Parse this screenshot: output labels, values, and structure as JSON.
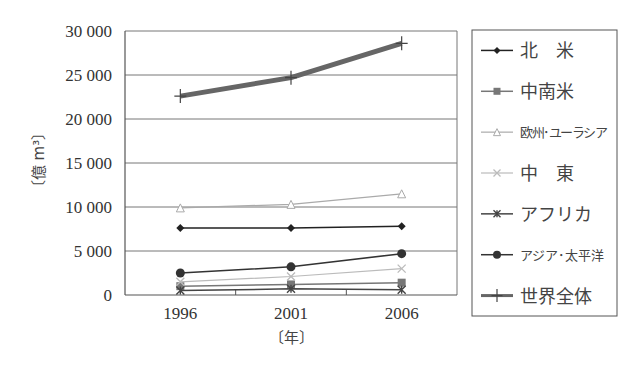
{
  "chart_data": {
    "type": "line",
    "title": "",
    "xlabel": "〔年〕",
    "ylabel": "〔億 m³〕",
    "x": [
      "1996",
      "2001",
      "2006"
    ],
    "ylim": [
      0,
      30000
    ],
    "yticks": [
      0,
      5000,
      10000,
      15000,
      20000,
      25000,
      30000
    ],
    "ytick_labels": [
      "0",
      "5 000",
      "10 000",
      "15 000",
      "20 000",
      "25 000",
      "30 000"
    ],
    "grid": "horizontal",
    "legend_position": "right",
    "series": [
      {
        "name": "北　米",
        "values": [
          7600,
          7600,
          7800
        ],
        "marker": "diamond",
        "color": "#222222",
        "width": 1.5
      },
      {
        "name": "中南米",
        "values": [
          1000,
          1200,
          1400
        ],
        "marker": "square",
        "color": "#777777",
        "width": 1.5
      },
      {
        "name": "欧州･ユーラシア",
        "values": [
          9900,
          10300,
          11500
        ],
        "marker": "triangle",
        "color": "#aaaaaa",
        "width": 1.2
      },
      {
        "name": "中　東",
        "values": [
          1500,
          2100,
          3000
        ],
        "marker": "x",
        "color": "#bbbbbb",
        "width": 1.2
      },
      {
        "name": "アフリカ",
        "values": [
          500,
          700,
          600
        ],
        "marker": "star",
        "color": "#444444",
        "width": 1.5
      },
      {
        "name": "アジア･太平洋",
        "values": [
          2500,
          3200,
          4700
        ],
        "marker": "circle",
        "color": "#333333",
        "width": 1.5
      },
      {
        "name": "世界全体",
        "values": [
          22600,
          24700,
          28600
        ],
        "marker": "plus",
        "color": "#666666",
        "width": 5
      }
    ]
  }
}
